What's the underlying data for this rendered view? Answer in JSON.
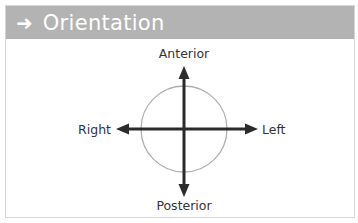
{
  "header": {
    "icon": "arrow-right-icon",
    "icon_glyph": "➜",
    "title": "Orientation",
    "background": "#b3b3b3",
    "text_color": "#ffffff"
  },
  "diagram": {
    "labels": {
      "top": "Anterior",
      "bottom": "Posterior",
      "left": "Right",
      "right": "Left"
    },
    "circle_color": "#b0b0b0",
    "arrow_color": "#2b2b2b"
  }
}
